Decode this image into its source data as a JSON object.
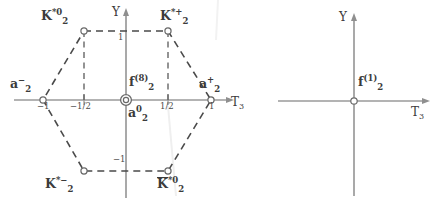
{
  "figure": {
    "panels": [
      {
        "id": "octet",
        "name": "octet-weight-diagram",
        "axes": {
          "y_label": "Y",
          "x_label": "T",
          "x_label_sub": "3",
          "origin": {
            "x": 126,
            "y": 100
          }
        },
        "ticks": {
          "x": [
            {
              "label": "−1",
              "value": -1,
              "px": 43
            },
            {
              "label": "−1/2",
              "value": -0.5,
              "px": 84
            },
            {
              "label": "1/2",
              "value": 0.5,
              "px": 168
            },
            {
              "label": "1",
              "value": 1,
              "px": 211
            }
          ],
          "y": [
            {
              "label": "1",
              "value": 1,
              "px": 31
            },
            {
              "label": "−1",
              "value": -1,
              "px": 171
            }
          ]
        },
        "states": [
          {
            "name": "K2star0",
            "base": "K",
            "sub": "2",
            "sup": "*0",
            "overline": false,
            "t3": -0.5,
            "y": 1,
            "marker": "open-circle"
          },
          {
            "name": "K2starplus",
            "base": "K",
            "sub": "2",
            "sup": "*+",
            "overline": false,
            "t3": 0.5,
            "y": 1,
            "marker": "open-circle"
          },
          {
            "name": "a2minus",
            "base": "a",
            "sub": "2",
            "sup": "−",
            "overline": false,
            "t3": -1,
            "y": 0,
            "marker": "open-circle"
          },
          {
            "name": "a2plus",
            "base": "a",
            "sub": "2",
            "sup": "+",
            "overline": false,
            "t3": 1,
            "y": 0,
            "marker": "open-circle"
          },
          {
            "name": "f2octet",
            "base": "f",
            "sub": "2",
            "sup": "(8)",
            "overline": false,
            "t3": 0,
            "y": 0,
            "marker": "double-circle"
          },
          {
            "name": "a2zero",
            "base": "a",
            "sub": "2",
            "sup": "0",
            "overline": false,
            "t3": 0,
            "y": 0,
            "marker": "double-circle"
          },
          {
            "name": "K2starminus",
            "base": "K",
            "sub": "2",
            "sup": "*−",
            "overline": false,
            "t3": -0.5,
            "y": -1,
            "marker": "open-circle"
          },
          {
            "name": "K2starbar0",
            "base": "K",
            "sub": "2",
            "sup": "*0",
            "overline": true,
            "t3": 0.5,
            "y": -1,
            "marker": "open-circle"
          }
        ],
        "hexagon_vertices": [
          {
            "t3": -0.5,
            "y": 1
          },
          {
            "t3": 0.5,
            "y": 1
          },
          {
            "t3": 1,
            "y": 0
          },
          {
            "t3": 0.5,
            "y": -1
          },
          {
            "t3": -0.5,
            "y": -1
          },
          {
            "t3": -1,
            "y": 0
          }
        ]
      },
      {
        "id": "singlet",
        "name": "singlet-weight-diagram",
        "axes": {
          "y_label": "Y",
          "x_label": "T",
          "x_label_sub": "3",
          "origin": {
            "x": 354,
            "y": 101
          }
        },
        "ticks": {
          "x": [],
          "y": []
        },
        "states": [
          {
            "name": "f2singlet",
            "base": "f",
            "sub": "2",
            "sup": "(1)",
            "overline": false,
            "t3": 0,
            "y": 0,
            "marker": "open-circle"
          }
        ],
        "hexagon_vertices": []
      }
    ],
    "colors": {
      "axis": "#9a9a9a",
      "dashed": "#4a4a4a",
      "text": "#3b3b3b",
      "marker_stroke": "#6a6a6a",
      "background": "#ffffff"
    }
  },
  "labels": {
    "K2star0": {
      "base": "K",
      "sub": "2",
      "sup": "*0"
    },
    "K2starplus": {
      "base": "K",
      "sub": "2",
      "sup": "*+"
    },
    "K2starminus": {
      "base": "K",
      "sub": "2",
      "sup": "*−"
    },
    "K2starbar0": {
      "base": "K",
      "sub": "2",
      "sup": "*0"
    },
    "a2minus": {
      "base": "a",
      "sub": "2",
      "sup": "−"
    },
    "a2plus": {
      "base": "a",
      "sub": "2",
      "sup": "+"
    },
    "a2zero": {
      "base": "a",
      "sub": "2",
      "sup": "0"
    },
    "f2octet": {
      "base": "f",
      "sub": "2",
      "sup": "(8)"
    },
    "f2singlet": {
      "base": "f",
      "sub": "2",
      "sup": "(1)"
    },
    "axis_y_left": "Y",
    "axis_y_right": "Y",
    "axis_t3_left": "T",
    "axis_t3_left_sub": "3",
    "axis_t3_right": "T",
    "axis_t3_right_sub": "3",
    "tick_x_neg1": "−1",
    "tick_x_neghalf": "−1/2",
    "tick_x_half": "1/2",
    "tick_x_pos1": "1",
    "tick_y_pos1": "1",
    "tick_y_neg1": "−1"
  }
}
